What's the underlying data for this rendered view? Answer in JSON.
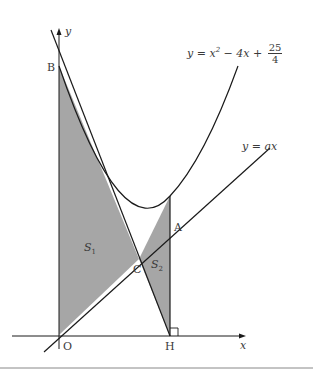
{
  "figure": {
    "equations": {
      "parabola_prefix": "y = x",
      "parabola_exp": "2",
      "parabola_mid": " − 4x + ",
      "parabola_frac_num": "25",
      "parabola_frac_den": "4",
      "line": "y = ax"
    },
    "axes": {
      "x_label": "x",
      "y_label": "y"
    },
    "points": {
      "origin": "O",
      "B": "B",
      "A": "A",
      "C": "C",
      "H": "H"
    },
    "regions": {
      "s1_main": "S",
      "s1_sub": "1",
      "s2_main": "S",
      "s2_sub": "2"
    },
    "colors": {
      "shade": "#a6a6a6",
      "stroke": "#1a1a1a",
      "text": "#3a3a3a",
      "rule": "#888888"
    }
  }
}
